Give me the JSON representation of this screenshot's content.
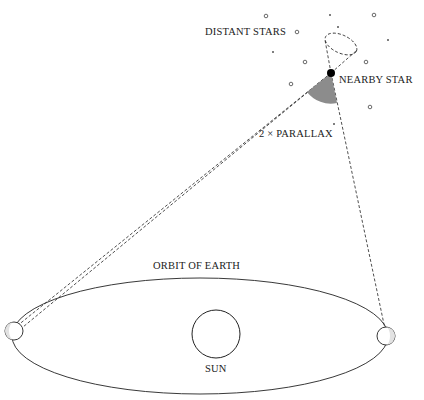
{
  "diagram": {
    "labels": {
      "distant_stars": "DISTANT STARS",
      "nearby_star": "NEARBY STAR",
      "parallax": "2 × PARALLAX",
      "orbit": "ORBIT OF EARTH",
      "sun": "SUN"
    },
    "colors": {
      "line": "#222222",
      "sector_fill": "#8c8c8c",
      "background": "#ffffff"
    }
  }
}
